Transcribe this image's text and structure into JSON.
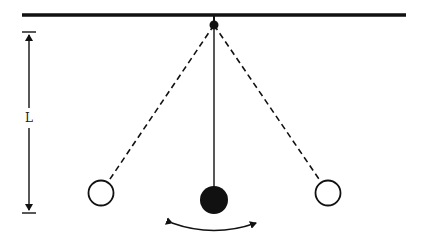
{
  "diagram": {
    "type": "simple-pendulum",
    "length_label": "L",
    "colors": {
      "line": "#111111",
      "bob_fill": "#111111",
      "ghost_bob_fill": "#ffffff",
      "background": "#ffffff"
    },
    "elements": {
      "ceiling": {
        "x1": 22,
        "x2": 406,
        "y": 15
      },
      "pivot": {
        "cx": 214,
        "cy": 25,
        "r": 4
      },
      "string_rest": {
        "x1": 214,
        "y1": 25,
        "x2": 214,
        "y2": 187
      },
      "bob_rest": {
        "cx": 214,
        "cy": 200,
        "r": 14
      },
      "string_left": {
        "x1": 214,
        "y1": 25,
        "x2": 108,
        "y2": 182
      },
      "bob_left": {
        "cx": 101,
        "cy": 193,
        "r": 13
      },
      "string_right": {
        "x1": 214,
        "y1": 25,
        "x2": 321,
        "y2": 182
      },
      "bob_right": {
        "cx": 328,
        "cy": 193,
        "r": 13
      },
      "length_arrow": {
        "x": 29,
        "y1": 32,
        "y2": 213
      },
      "swing_arc": {
        "x1": 170,
        "x2": 258,
        "y": 223
      }
    }
  }
}
